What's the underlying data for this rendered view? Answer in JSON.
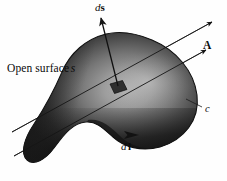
{
  "figure": {
    "kind": "vector-calculus-diagram",
    "background_color": "#fefefe",
    "width": 227,
    "height": 181,
    "labels": {
      "open_surface": {
        "text_plain": "Open surface",
        "symbol": "s",
        "full": "Open surface s"
      },
      "area_element": {
        "differential": "d",
        "symbol": "s",
        "full": "ds"
      },
      "line_element": {
        "differential": "d",
        "symbol": "l",
        "full": "dl"
      },
      "field_vector": {
        "full": "A"
      },
      "contour": {
        "full": "c"
      }
    },
    "colors": {
      "ink": "#0b0b0b",
      "surface_dark": "#1b1b1b",
      "surface_mid": "#4a4a4a",
      "surface_highlight": "#a9a9a9",
      "surface_edge": "#141414",
      "patch_fill": "#2e2e2e",
      "line_stroke": "#232323"
    },
    "geometry": {
      "surface_outline": "M 152 40 C 176 50 194 71 197 95 C 200 120 184 140 160 147 C 141 152 124 147 113 137 C 103 128 96 121 86 122 C 72 123 63 136 54 148 C 45 160 34 166 27 160 C 20 153 24 139 34 124 C 47 104 56 86 62 72 C 70 53 86 39 106 34 C 123 30 138 34 152 40 Z",
      "patch": "M 110 84 L 122 81 L 127 90 L 115 94 Z",
      "ds_arrow": {
        "x1": 118,
        "y1": 86,
        "x2": 101,
        "y2": 18
      },
      "field_line_upper": {
        "x1": 12,
        "y1": 132,
        "x2": 212,
        "y2": 22
      },
      "field_line_lower": {
        "x1": 14,
        "y1": 156,
        "x2": 206,
        "y2": 50
      },
      "c_leader": {
        "x1": 203,
        "y1": 108,
        "x2": 186,
        "y2": 99
      },
      "dl_arrow": {
        "x": 133,
        "y": 134
      }
    }
  }
}
